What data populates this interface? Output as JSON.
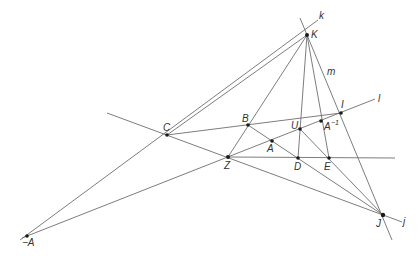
{
  "diagram": {
    "points": [
      {
        "id": "K",
        "label": "K",
        "x": 307,
        "y": 35
      },
      {
        "id": "C",
        "label": "C",
        "x": 167,
        "y": 135
      },
      {
        "id": "B",
        "label": "B",
        "x": 248,
        "y": 125
      },
      {
        "id": "A",
        "label": "A",
        "x": 272,
        "y": 141
      },
      {
        "id": "U",
        "label": "U",
        "x": 300,
        "y": 129
      },
      {
        "id": "Ainv",
        "label": "A",
        "sup": "−1",
        "x": 321,
        "y": 121
      },
      {
        "id": "I",
        "label": "I",
        "x": 341,
        "y": 113
      },
      {
        "id": "Z",
        "label": "Z",
        "x": 228,
        "y": 157
      },
      {
        "id": "D",
        "label": "D",
        "x": 298,
        "y": 158
      },
      {
        "id": "E",
        "label": "E",
        "x": 329,
        "y": 158
      },
      {
        "id": "J",
        "label": "J",
        "x": 383,
        "y": 215
      },
      {
        "id": "negA",
        "label": "−A",
        "x": 27,
        "y": 236
      }
    ],
    "line_labels": {
      "k": "k",
      "l": "l",
      "m": "m",
      "j": "j"
    }
  }
}
